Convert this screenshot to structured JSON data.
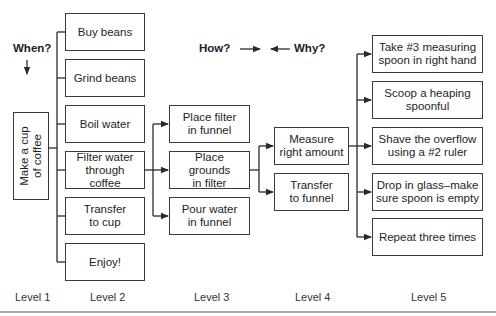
{
  "annotations": {
    "when": "When?",
    "how": "How?",
    "why": "Why?"
  },
  "level1": {
    "root": "Make a cup\nof coffee"
  },
  "level2": {
    "items": [
      "Buy beans",
      "Grind beans",
      "Boil water",
      "Filter water\nthrough coffee",
      "Transfer\nto cup",
      "Enjoy!"
    ]
  },
  "level3": {
    "items": [
      "Place filter\nin funnel",
      "Place grounds\nin filter",
      "Pour water\nin funnel"
    ]
  },
  "level4": {
    "items": [
      "Measure\nright amount",
      "Transfer\nto funnel"
    ]
  },
  "level5": {
    "items": [
      "Take #3 measuring\nspoon in right hand",
      "Scoop a heaping\nspoonful",
      "Shave the overflow\nusing a #2 ruler",
      "Drop in glass–make\nsure spoon is empty",
      "Repeat three times"
    ]
  },
  "level_labels": [
    "Level 1",
    "Level 2",
    "Level 3",
    "Level 4",
    "Level 5"
  ],
  "colors": {
    "line": "#2a2a2a",
    "box_border": "#3a3a3a",
    "background": "#ffffff"
  }
}
